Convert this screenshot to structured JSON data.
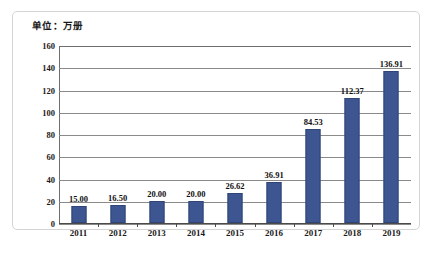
{
  "chart_data": {
    "type": "bar",
    "title": "",
    "unit_label": "单位：万册",
    "xlabel": "",
    "ylabel": "",
    "categories": [
      "2011",
      "2012",
      "2013",
      "2014",
      "2015",
      "2016",
      "2017",
      "2018",
      "2019"
    ],
    "values": [
      15.0,
      16.5,
      20.0,
      20.0,
      26.62,
      36.91,
      84.53,
      112.37,
      136.91
    ],
    "value_labels": [
      "15.00",
      "16.50",
      "20.00",
      "20.00",
      "26.62",
      "36.91",
      "84.53",
      "112.37",
      "136.91"
    ],
    "ylim": [
      0,
      160
    ],
    "yticks": [
      0,
      20,
      40,
      60,
      80,
      100,
      120,
      140,
      160
    ],
    "ytick_labels": [
      "0",
      "20",
      "40",
      "60",
      "80",
      "100",
      "120",
      "140",
      "160"
    ],
    "grid": true,
    "legend": "none",
    "series": [
      {
        "name": "",
        "color": "#3d5691",
        "values": [
          15.0,
          16.5,
          20.0,
          20.0,
          26.62,
          36.91,
          84.53,
          112.37,
          136.91
        ]
      }
    ]
  },
  "colors": {
    "bar": "#3d5691",
    "bar_border": "#2f4577",
    "gridline": "#8a8a8a",
    "axis": "#4a4a4a",
    "frame": "#d4d4d4",
    "text": "#1a1a1a",
    "background": "#ffffff"
  },
  "caption": {
    "text": ""
  }
}
